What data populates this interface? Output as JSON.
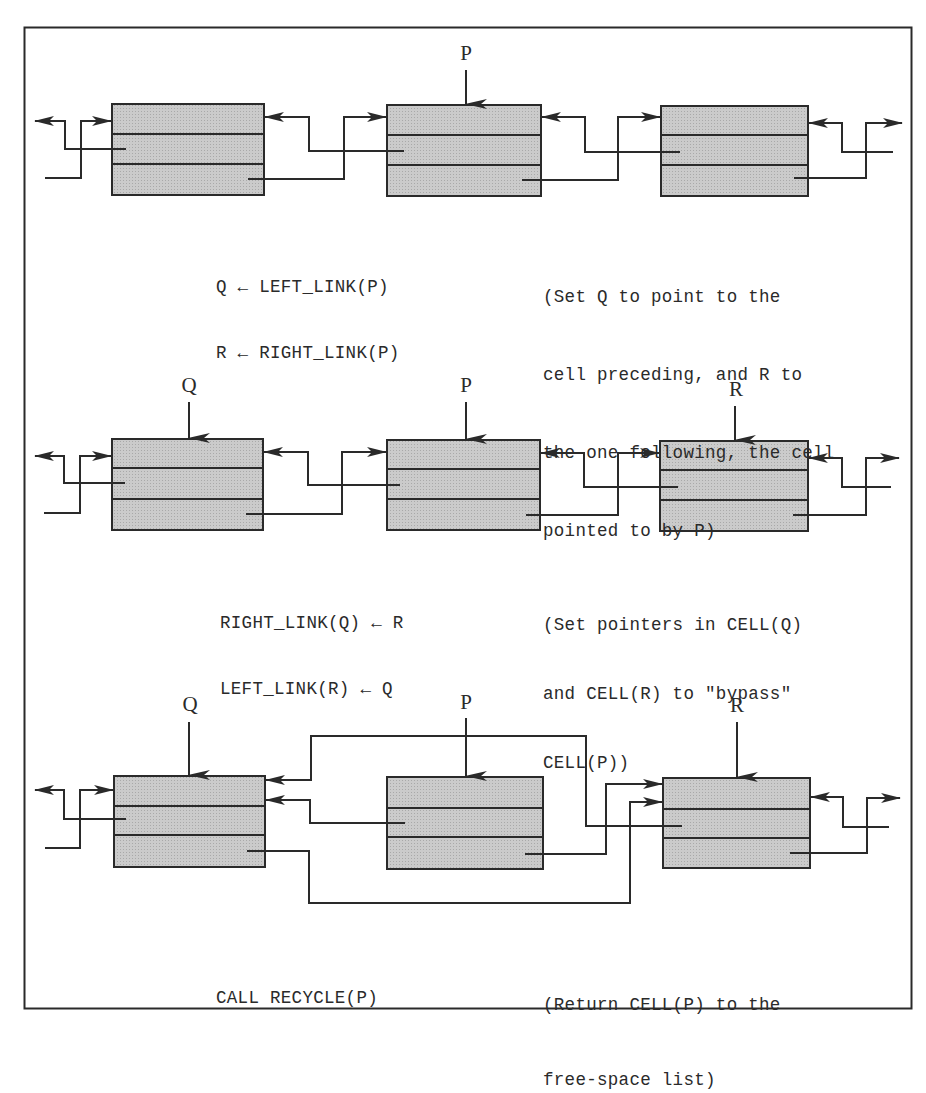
{
  "figure": {
    "colors": {
      "cell_fill": "#c4c4c4",
      "stroke": "#2a2a2a",
      "background": "#ffffff"
    },
    "cell_fields": [
      "LEFT_LINK",
      "RIGHT_LINK",
      "DATA"
    ]
  },
  "steps": [
    {
      "pointers": [
        {
          "label": "P",
          "cell": 2
        }
      ],
      "code": [
        "Q ← LEFT_LINK(P)",
        "R ← RIGHT_LINK(P)"
      ],
      "comment": [
        "(Set Q to point to the",
        "cell preceding, and R to",
        "the one following, the cell",
        "pointed to by P)"
      ]
    },
    {
      "pointers": [
        {
          "label": "Q",
          "cell": 1
        },
        {
          "label": "P",
          "cell": 2
        },
        {
          "label": "R",
          "cell": 3
        }
      ],
      "code": [
        "RIGHT_LINK(Q) ← R",
        "LEFT_LINK(R) ← Q"
      ],
      "comment": [
        "(Set pointers in CELL(Q)",
        "and CELL(R) to \"bypass\"",
        "CELL(P))"
      ]
    },
    {
      "pointers": [
        {
          "label": "Q",
          "cell": 1
        },
        {
          "label": "P",
          "cell": 2
        },
        {
          "label": "R",
          "cell": 3
        }
      ],
      "code": [
        "CALL RECYCLE(P)"
      ],
      "comment": [
        "(Return CELL(P) to the",
        "free-space list)"
      ]
    }
  ]
}
